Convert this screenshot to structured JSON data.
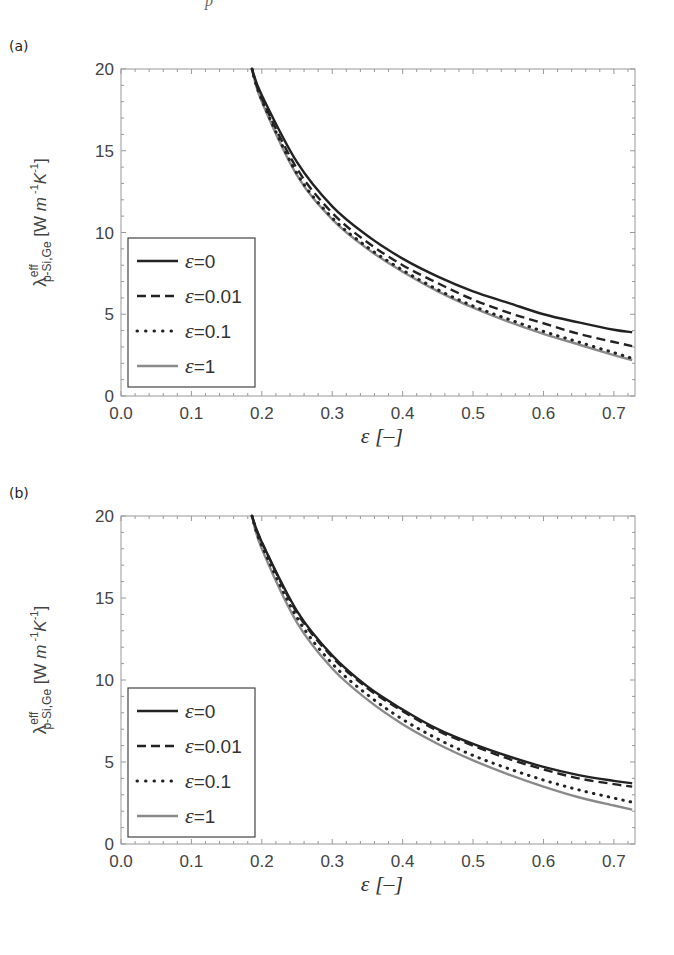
{
  "page": {
    "top_fragment": "p"
  },
  "chart_data": [
    {
      "panel_label": "(a)",
      "type": "line",
      "xlabel": "ε [–]",
      "ylabel": {
        "symbol": "λ",
        "superscript": "eff",
        "subscript": "p-Si,Ge",
        "units": "[W m",
        "units_exp1": "-1",
        "units_mid": "K",
        "units_exp2": "-1",
        "units_close": "]"
      },
      "xlim": [
        0.0,
        0.73
      ],
      "ylim": [
        0,
        20
      ],
      "xticks": [
        0.0,
        0.1,
        0.2,
        0.3,
        0.4,
        0.5,
        0.6,
        0.7
      ],
      "xtick_labels": [
        "0.0",
        "0.1",
        "0.2",
        "0.3",
        "0.4",
        "0.5",
        "0.6",
        "0.7"
      ],
      "yticks": [
        0,
        5,
        10,
        15,
        20
      ],
      "ytick_labels": [
        "0",
        "5",
        "10",
        "15",
        "20"
      ],
      "grid": false,
      "legend_position": "bottom-left",
      "series": [
        {
          "name": "ε=0",
          "style": "solid",
          "color": "#222222",
          "x": [
            0.186,
            0.2,
            0.25,
            0.3,
            0.35,
            0.4,
            0.45,
            0.5,
            0.55,
            0.6,
            0.65,
            0.7,
            0.726
          ],
          "y": [
            20.0,
            18.4,
            14.3,
            11.6,
            9.8,
            8.4,
            7.3,
            6.4,
            5.7,
            5.0,
            4.5,
            4.05,
            3.9
          ]
        },
        {
          "name": "ε=0.01",
          "style": "dashed",
          "color": "#222222",
          "x": [
            0.186,
            0.2,
            0.25,
            0.3,
            0.35,
            0.4,
            0.45,
            0.5,
            0.55,
            0.6,
            0.65,
            0.7,
            0.726
          ],
          "y": [
            20.0,
            18.2,
            13.9,
            11.2,
            9.4,
            8.0,
            6.9,
            5.9,
            5.1,
            4.45,
            3.8,
            3.3,
            3.05
          ]
        },
        {
          "name": "ε=0.1",
          "style": "dotted",
          "color": "#222222",
          "x": [
            0.186,
            0.2,
            0.25,
            0.3,
            0.35,
            0.4,
            0.45,
            0.5,
            0.55,
            0.6,
            0.65,
            0.7,
            0.726
          ],
          "y": [
            20.0,
            18.1,
            13.6,
            10.9,
            9.1,
            7.7,
            6.5,
            5.5,
            4.7,
            3.95,
            3.3,
            2.65,
            2.3
          ]
        },
        {
          "name": "ε=1",
          "style": "solid",
          "color": "#8a8a8a",
          "x": [
            0.186,
            0.2,
            0.25,
            0.3,
            0.35,
            0.4,
            0.45,
            0.5,
            0.55,
            0.6,
            0.65,
            0.7,
            0.726
          ],
          "y": [
            20.0,
            18.0,
            13.5,
            10.8,
            9.0,
            7.6,
            6.4,
            5.4,
            4.55,
            3.8,
            3.15,
            2.5,
            2.2
          ]
        }
      ]
    },
    {
      "panel_label": "(b)",
      "type": "line",
      "xlabel": "ε [–]",
      "ylabel": {
        "symbol": "λ",
        "superscript": "eff",
        "subscript": "p-Si,Ge",
        "units": "[W m",
        "units_exp1": "-1",
        "units_mid": "K",
        "units_exp2": "-1",
        "units_close": "]"
      },
      "xlim": [
        0.0,
        0.73
      ],
      "ylim": [
        0,
        20
      ],
      "xticks": [
        0.0,
        0.1,
        0.2,
        0.3,
        0.4,
        0.5,
        0.6,
        0.7
      ],
      "xtick_labels": [
        "0.0",
        "0.1",
        "0.2",
        "0.3",
        "0.4",
        "0.5",
        "0.6",
        "0.7"
      ],
      "yticks": [
        0,
        5,
        10,
        15,
        20
      ],
      "ytick_labels": [
        "0",
        "5",
        "10",
        "15",
        "20"
      ],
      "grid": false,
      "legend_position": "bottom-left",
      "series": [
        {
          "name": "ε=0",
          "style": "solid",
          "color": "#222222",
          "x": [
            0.186,
            0.2,
            0.25,
            0.3,
            0.35,
            0.4,
            0.45,
            0.5,
            0.55,
            0.6,
            0.65,
            0.7,
            0.726
          ],
          "y": [
            20.0,
            18.4,
            14.2,
            11.5,
            9.6,
            8.2,
            7.0,
            6.1,
            5.35,
            4.7,
            4.2,
            3.85,
            3.7
          ]
        },
        {
          "name": "ε=0.01",
          "style": "dashed",
          "color": "#222222",
          "x": [
            0.186,
            0.2,
            0.25,
            0.3,
            0.35,
            0.4,
            0.45,
            0.5,
            0.55,
            0.6,
            0.65,
            0.7,
            0.726
          ],
          "y": [
            20.0,
            18.4,
            14.1,
            11.4,
            9.5,
            8.1,
            6.9,
            6.0,
            5.2,
            4.55,
            4.0,
            3.65,
            3.5
          ]
        },
        {
          "name": "ε=0.1",
          "style": "dotted",
          "color": "#222222",
          "x": [
            0.186,
            0.2,
            0.25,
            0.3,
            0.35,
            0.4,
            0.45,
            0.5,
            0.55,
            0.6,
            0.65,
            0.7,
            0.726
          ],
          "y": [
            20.0,
            18.2,
            13.8,
            11.0,
            9.1,
            7.6,
            6.4,
            5.4,
            4.6,
            3.9,
            3.3,
            2.8,
            2.55
          ]
        },
        {
          "name": "ε=1",
          "style": "solid",
          "color": "#8a8a8a",
          "x": [
            0.186,
            0.2,
            0.25,
            0.3,
            0.35,
            0.4,
            0.45,
            0.5,
            0.55,
            0.6,
            0.65,
            0.7,
            0.726
          ],
          "y": [
            20.0,
            18.0,
            13.5,
            10.7,
            8.8,
            7.3,
            6.1,
            5.1,
            4.25,
            3.5,
            2.85,
            2.35,
            2.1
          ]
        }
      ]
    }
  ]
}
